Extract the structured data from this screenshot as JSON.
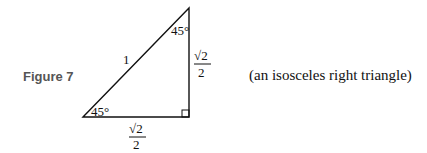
{
  "figure": {
    "label": "Figure 7",
    "caption": "(an isosceles right triangle)"
  },
  "triangle": {
    "hypotenuse_label": "1",
    "top_angle": "45°",
    "bottom_left_angle": "45°",
    "right_side": {
      "numerator": "√2",
      "denominator": "2"
    },
    "bottom_side": {
      "numerator": "√2",
      "denominator": "2"
    },
    "right_angle_marker": true,
    "stroke_color": "#111111"
  }
}
